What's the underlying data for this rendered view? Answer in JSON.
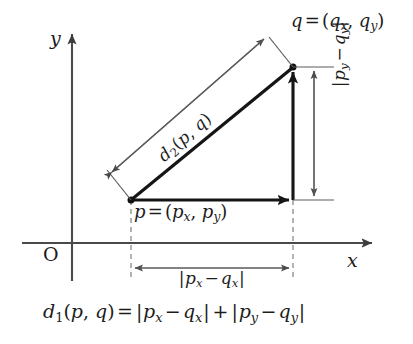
{
  "figure": {
    "background_color": "#ffffff",
    "ink_color": "#1c1c1c",
    "thin_line_color": "#555555"
  },
  "axes": {
    "x_label": "x",
    "y_label": "y",
    "origin_label": "O"
  },
  "points": {
    "p": {
      "label_full": "p = (p_x, p_y)",
      "name": "p",
      "equals": "=",
      "open": "(",
      "coord_x_base": "p",
      "coord_x_sub": "x",
      "comma": ", ",
      "coord_y_base": "p",
      "coord_y_sub": "y",
      "close": ")"
    },
    "q": {
      "label_full": "q = (q_x, q_y)",
      "name": "q",
      "equals": "=",
      "open": "(",
      "coord_x_base": "q",
      "coord_x_sub": "x",
      "comma": ", ",
      "coord_y_base": "q",
      "coord_y_sub": "y",
      "close": ")"
    }
  },
  "measurements": {
    "horizontal": {
      "label_full": "|p_x - q_x|",
      "bar_open": "|",
      "term1_base": "p",
      "term1_sub": "x",
      "operator": "−",
      "term2_base": "q",
      "term2_sub": "x",
      "bar_close": "|"
    },
    "vertical": {
      "label_full": "|p_y - q_y|",
      "bar_open": "|",
      "term1_base": "p",
      "term1_sub": "y",
      "operator": "−",
      "term2_base": "q",
      "term2_sub": "y",
      "bar_close": "|"
    },
    "diagonal": {
      "label_full": "d_2(p, q)",
      "name_base": "d",
      "name_sub": "2",
      "open": "(",
      "arg1": "p",
      "comma": ", ",
      "arg2": "q",
      "close": ")"
    }
  },
  "formula": {
    "full_text": "d_1(p, q) = |p_x - q_x| + |p_y - q_y|",
    "lhs_base": "d",
    "lhs_sub": "1",
    "lhs_open": "(",
    "lhs_arg1": "p",
    "lhs_comma": ", ",
    "lhs_arg2": "q",
    "lhs_close": ")",
    "equals": "=",
    "bar1_open": "|",
    "t1_base": "p",
    "t1_sub": "x",
    "minus1": "−",
    "t2_base": "q",
    "t2_sub": "x",
    "bar1_close": "|",
    "plus": "+",
    "bar2_open": "|",
    "t3_base": "p",
    "t3_sub": "y",
    "minus2": "−",
    "t4_base": "q",
    "t4_sub": "y",
    "bar2_close": "|"
  },
  "geometry": {
    "p_x": 131,
    "p_y": 200,
    "q_x": 293,
    "q_y": 67,
    "x_axis_y": 243,
    "y_axis_x": 72
  }
}
